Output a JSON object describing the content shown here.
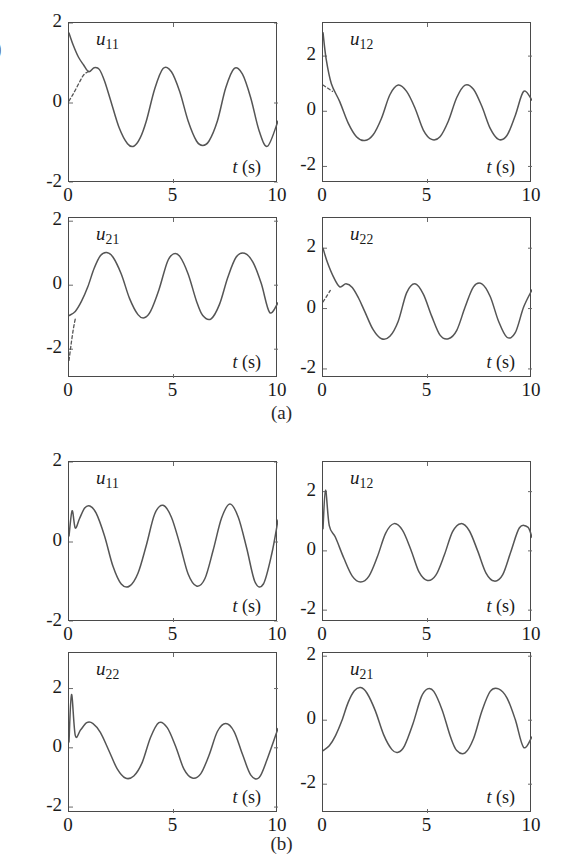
{
  "figure": {
    "edge_artifact": ")",
    "panels": [
      {
        "id": "a",
        "caption": "(a)",
        "subplots": [
          {
            "name": "u11",
            "label_base": "u",
            "label_sub": "11",
            "xlabel_italic": "t",
            "xlabel_rest": " (s)",
            "yticks": [
              "2",
              "0",
              "-2"
            ],
            "ytick_vals": [
              2,
              0,
              -2
            ],
            "xticks": [
              "0",
              "5",
              "10"
            ],
            "xtick_vals": [
              0,
              5,
              10
            ],
            "ylim": [
              -2,
              2
            ],
            "xlim": [
              0,
              10
            ],
            "has_dashed": true
          },
          {
            "name": "u12",
            "label_base": "u",
            "label_sub": "12",
            "xlabel_italic": "t",
            "xlabel_rest": " (s)",
            "yticks": [
              "2",
              "0",
              "-2"
            ],
            "ytick_vals": [
              2,
              0,
              -2
            ],
            "xticks": [
              "0",
              "5",
              "10"
            ],
            "xtick_vals": [
              0,
              5,
              10
            ],
            "ylim": [
              -2.6,
              3.2
            ],
            "xlim": [
              0,
              10
            ],
            "has_dashed": true
          },
          {
            "name": "u21",
            "label_base": "u",
            "label_sub": "21",
            "xlabel_italic": "t",
            "xlabel_rest": " (s)",
            "yticks": [
              "2",
              "0",
              "-2"
            ],
            "ytick_vals": [
              2,
              0,
              -2
            ],
            "xticks": [
              "0",
              "5",
              "10"
            ],
            "xtick_vals": [
              0,
              5,
              10
            ],
            "ylim": [
              -2.9,
              2.1
            ],
            "xlim": [
              0,
              10
            ],
            "has_dashed": true
          },
          {
            "name": "u22",
            "label_base": "u",
            "label_sub": "22",
            "xlabel_italic": "t",
            "xlabel_rest": " (s)",
            "yticks": [
              "2",
              "0",
              "-2"
            ],
            "ytick_vals": [
              2,
              0,
              -2
            ],
            "xticks": [
              "0",
              "5",
              "10"
            ],
            "xtick_vals": [
              0,
              5,
              10
            ],
            "ylim": [
              -2.3,
              3.0
            ],
            "xlim": [
              0,
              10
            ],
            "has_dashed": true
          }
        ]
      },
      {
        "id": "b",
        "caption": "(b)",
        "subplots": [
          {
            "name": "u11",
            "label_base": "u",
            "label_sub": "11",
            "xlabel_italic": "t",
            "xlabel_rest": " (s)",
            "yticks": [
              "2",
              "0",
              "-2"
            ],
            "ytick_vals": [
              2,
              0,
              -2
            ],
            "xticks": [
              "0",
              "5",
              "10"
            ],
            "xtick_vals": [
              0,
              5,
              10
            ],
            "ylim": [
              -2,
              2
            ],
            "xlim": [
              0,
              10
            ],
            "has_dashed": false
          },
          {
            "name": "u12",
            "label_base": "u",
            "label_sub": "12",
            "xlabel_italic": "t",
            "xlabel_rest": " (s)",
            "yticks": [
              "2",
              "0",
              "-2"
            ],
            "ytick_vals": [
              2,
              0,
              -2
            ],
            "xticks": [
              "0",
              "5",
              "10"
            ],
            "xtick_vals": [
              0,
              5,
              10
            ],
            "ylim": [
              -2.4,
              3.0
            ],
            "xlim": [
              0,
              10
            ],
            "has_dashed": false
          },
          {
            "name": "u22",
            "label_base": "u",
            "label_sub": "22",
            "xlabel_italic": "t",
            "xlabel_rest": " (s)",
            "yticks": [
              "2",
              "0",
              "-2"
            ],
            "ytick_vals": [
              2,
              0,
              -2
            ],
            "xticks": [
              "0",
              "5",
              "10"
            ],
            "xtick_vals": [
              0,
              5,
              10
            ],
            "ylim": [
              -2.2,
              3.2
            ],
            "xlim": [
              0,
              10
            ],
            "has_dashed": false
          },
          {
            "name": "u21",
            "label_base": "u",
            "label_sub": "21",
            "xlabel_italic": "t",
            "xlabel_rest": " (s)",
            "yticks": [
              "2",
              "0",
              "-2"
            ],
            "ytick_vals": [
              2,
              0,
              -2
            ],
            "xticks": [
              "0",
              "5",
              "10"
            ],
            "xtick_vals": [
              0,
              5,
              10
            ],
            "ylim": [
              -2.9,
              2.1
            ],
            "xlim": [
              0,
              10
            ],
            "has_dashed": false
          }
        ]
      }
    ]
  },
  "chart_data": [
    {
      "type": "line",
      "title": "u11 (a)",
      "xlabel": "t (s)",
      "ylabel": "u11",
      "xlim": [
        0,
        10
      ],
      "ylim": [
        -2,
        2
      ],
      "xticks": [
        0,
        5,
        10
      ],
      "yticks": [
        -2,
        0,
        2
      ],
      "grid": false,
      "legend": "none",
      "series": [
        {
          "name": "solid",
          "style": "solid",
          "x": [
            0,
            0.2,
            0.45,
            0.7,
            0.95,
            1.2,
            1.45,
            1.7,
            2.0,
            2.4,
            2.8,
            3.1,
            3.4,
            3.7,
            4.1,
            4.5,
            4.9,
            5.3,
            5.7,
            6.1,
            6.4,
            6.7,
            7.1,
            7.5,
            7.9,
            8.3,
            8.7,
            9.1,
            9.5,
            10.0
          ],
          "y": [
            1.75,
            1.45,
            1.15,
            0.95,
            0.78,
            0.88,
            0.84,
            0.55,
            0.05,
            -0.62,
            -1.02,
            -1.08,
            -0.88,
            -0.45,
            0.35,
            0.86,
            0.78,
            0.28,
            -0.45,
            -0.95,
            -1.06,
            -0.95,
            -0.45,
            0.38,
            0.86,
            0.72,
            0.12,
            -0.7,
            -1.08,
            -0.45
          ]
        },
        {
          "name": "dashed-transient",
          "style": "dashed",
          "x": [
            0,
            0.15,
            0.3,
            0.5,
            0.7,
            0.95
          ],
          "y": [
            0.05,
            0.18,
            0.32,
            0.52,
            0.7,
            0.8
          ]
        }
      ]
    },
    {
      "type": "line",
      "title": "u12 (a)",
      "xlabel": "t (s)",
      "ylabel": "u12",
      "xlim": [
        0,
        10
      ],
      "ylim": [
        -2.6,
        3.2
      ],
      "xticks": [
        0,
        5,
        10
      ],
      "yticks": [
        -2,
        0,
        2
      ],
      "grid": false,
      "legend": "none",
      "series": [
        {
          "name": "solid",
          "style": "solid",
          "x": [
            0,
            0.15,
            0.4,
            0.8,
            1.2,
            1.6,
            2.0,
            2.4,
            2.8,
            3.2,
            3.6,
            4.0,
            4.4,
            4.8,
            5.2,
            5.6,
            6.0,
            6.4,
            6.8,
            7.2,
            7.6,
            8.0,
            8.4,
            8.8,
            9.2,
            9.6,
            10.0
          ],
          "y": [
            2.85,
            1.9,
            1.0,
            0.35,
            -0.42,
            -0.92,
            -1.06,
            -0.85,
            -0.25,
            0.6,
            0.95,
            0.72,
            0.12,
            -0.68,
            -1.02,
            -0.92,
            -0.35,
            0.5,
            0.95,
            0.8,
            0.18,
            -0.62,
            -1.02,
            -0.88,
            -0.15,
            0.72,
            0.4
          ]
        },
        {
          "name": "dashed-transient",
          "style": "dashed",
          "x": [
            0,
            0.2,
            0.45
          ],
          "y": [
            0.95,
            0.85,
            0.72
          ]
        }
      ]
    },
    {
      "type": "line",
      "title": "u21 (a)",
      "xlabel": "t (s)",
      "ylabel": "u21",
      "xlim": [
        0,
        10
      ],
      "ylim": [
        -2.9,
        2.1
      ],
      "xticks": [
        0,
        5,
        10
      ],
      "yticks": [
        -2,
        0,
        2
      ],
      "grid": false,
      "legend": "none",
      "series": [
        {
          "name": "solid",
          "style": "solid",
          "x": [
            0,
            0.3,
            0.6,
            0.9,
            1.2,
            1.5,
            1.8,
            2.1,
            2.5,
            2.9,
            3.3,
            3.6,
            3.9,
            4.3,
            4.7,
            5.0,
            5.3,
            5.7,
            6.1,
            6.4,
            6.8,
            7.2,
            7.6,
            8.0,
            8.4,
            8.8,
            9.2,
            9.6,
            10.0
          ],
          "y": [
            -0.95,
            -0.82,
            -0.5,
            -0.05,
            0.52,
            0.92,
            1.02,
            0.88,
            0.35,
            -0.42,
            -0.92,
            -1.02,
            -0.82,
            -0.15,
            0.72,
            0.98,
            0.9,
            0.35,
            -0.5,
            -0.95,
            -1.05,
            -0.6,
            0.25,
            0.88,
            1.0,
            0.72,
            0.05,
            -0.85,
            -0.55
          ]
        },
        {
          "name": "dashed-transient",
          "style": "dashed",
          "x": [
            0,
            0.1,
            0.2,
            0.3
          ],
          "y": [
            -2.35,
            -1.85,
            -1.4,
            -1.05
          ]
        }
      ]
    },
    {
      "type": "line",
      "title": "u22 (a)",
      "xlabel": "t (s)",
      "ylabel": "u22",
      "xlim": [
        0,
        10
      ],
      "ylim": [
        -2.3,
        3.0
      ],
      "xticks": [
        0,
        5,
        10
      ],
      "yticks": [
        -2,
        0,
        2
      ],
      "grid": false,
      "legend": "none",
      "series": [
        {
          "name": "solid",
          "style": "solid",
          "x": [
            0,
            0.2,
            0.5,
            0.8,
            1.1,
            1.4,
            1.7,
            2.0,
            2.4,
            2.8,
            3.2,
            3.6,
            4.0,
            4.4,
            4.8,
            5.2,
            5.6,
            6.0,
            6.4,
            6.8,
            7.2,
            7.6,
            8.0,
            8.4,
            8.8,
            9.2,
            9.6,
            10.0
          ],
          "y": [
            2.0,
            1.55,
            1.05,
            0.72,
            0.82,
            0.7,
            0.35,
            -0.1,
            -0.7,
            -1.0,
            -0.92,
            -0.42,
            0.52,
            0.82,
            0.48,
            -0.25,
            -0.88,
            -1.0,
            -0.72,
            0.05,
            0.72,
            0.82,
            0.4,
            -0.42,
            -0.95,
            -0.8,
            0.05,
            0.62
          ]
        },
        {
          "name": "dashed-transient",
          "style": "dashed",
          "x": [
            0,
            0.15,
            0.35
          ],
          "y": [
            0.22,
            0.38,
            0.6
          ]
        }
      ]
    },
    {
      "type": "line",
      "title": "u11 (b)",
      "xlabel": "t (s)",
      "ylabel": "u11",
      "xlim": [
        0,
        10
      ],
      "ylim": [
        -2,
        2
      ],
      "xticks": [
        0,
        5,
        10
      ],
      "yticks": [
        -2,
        0,
        2
      ],
      "grid": false,
      "legend": "none",
      "series": [
        {
          "name": "solid",
          "style": "solid",
          "x": [
            0,
            0.15,
            0.3,
            0.5,
            0.75,
            1.0,
            1.3,
            1.7,
            2.1,
            2.5,
            2.9,
            3.3,
            3.7,
            4.1,
            4.5,
            4.9,
            5.3,
            5.7,
            6.1,
            6.5,
            6.9,
            7.3,
            7.7,
            8.1,
            8.5,
            8.9,
            9.3,
            9.7,
            10.0
          ],
          "y": [
            0.15,
            0.78,
            0.35,
            0.58,
            0.85,
            0.9,
            0.72,
            0.15,
            -0.6,
            -1.05,
            -1.1,
            -0.78,
            -0.08,
            0.7,
            0.92,
            0.62,
            -0.05,
            -0.8,
            -1.1,
            -0.92,
            -0.2,
            0.6,
            0.95,
            0.62,
            -0.15,
            -1.0,
            -1.05,
            -0.3,
            0.55
          ]
        }
      ]
    },
    {
      "type": "line",
      "title": "u12 (b)",
      "xlabel": "t (s)",
      "ylabel": "u12",
      "xlim": [
        0,
        10
      ],
      "ylim": [
        -2.4,
        3.0
      ],
      "xticks": [
        0,
        5,
        10
      ],
      "yticks": [
        -2,
        0,
        2
      ],
      "grid": false,
      "legend": "none",
      "series": [
        {
          "name": "solid",
          "style": "solid",
          "x": [
            0,
            0.12,
            0.3,
            0.6,
            1.0,
            1.4,
            1.8,
            2.2,
            2.6,
            3.0,
            3.4,
            3.8,
            4.2,
            4.6,
            5.0,
            5.4,
            5.8,
            6.2,
            6.6,
            7.0,
            7.4,
            7.8,
            8.2,
            8.6,
            9.0,
            9.4,
            9.8,
            10.0
          ],
          "y": [
            0.75,
            2.05,
            0.85,
            0.45,
            -0.25,
            -0.85,
            -1.05,
            -0.85,
            -0.2,
            0.6,
            0.92,
            0.7,
            0.05,
            -0.72,
            -1.0,
            -0.82,
            -0.15,
            0.65,
            0.92,
            0.68,
            0.0,
            -0.75,
            -1.02,
            -0.8,
            0.0,
            0.78,
            0.8,
            0.45
          ]
        }
      ]
    },
    {
      "type": "line",
      "title": "u22 (b)",
      "xlabel": "t (s)",
      "ylabel": "u22",
      "xlim": [
        0,
        10
      ],
      "ylim": [
        -2.2,
        3.2
      ],
      "xticks": [
        0,
        5,
        10
      ],
      "yticks": [
        -2,
        0,
        2
      ],
      "grid": false,
      "legend": "none",
      "series": [
        {
          "name": "solid",
          "style": "solid",
          "x": [
            0,
            0.12,
            0.3,
            0.55,
            0.85,
            1.15,
            1.5,
            1.9,
            2.3,
            2.7,
            3.1,
            3.5,
            3.9,
            4.3,
            4.7,
            5.1,
            5.5,
            5.9,
            6.3,
            6.7,
            7.1,
            7.5,
            7.9,
            8.3,
            8.7,
            9.1,
            9.5,
            10.0
          ],
          "y": [
            0.2,
            1.8,
            0.42,
            0.6,
            0.85,
            0.82,
            0.52,
            -0.08,
            -0.7,
            -1.02,
            -0.95,
            -0.5,
            0.35,
            0.85,
            0.68,
            0.05,
            -0.72,
            -1.02,
            -0.88,
            -0.25,
            0.55,
            0.82,
            0.55,
            -0.22,
            -0.92,
            -1.0,
            -0.35,
            0.65
          ]
        }
      ]
    },
    {
      "type": "line",
      "title": "u21 (b)",
      "xlabel": "t (s)",
      "ylabel": "u21",
      "xlim": [
        0,
        10
      ],
      "ylim": [
        -2.9,
        2.1
      ],
      "xticks": [
        0,
        5,
        10
      ],
      "yticks": [
        -2,
        0,
        2
      ],
      "grid": false,
      "legend": "none",
      "series": [
        {
          "name": "solid",
          "style": "solid",
          "x": [
            0,
            0.3,
            0.6,
            0.9,
            1.2,
            1.5,
            1.8,
            2.1,
            2.5,
            2.9,
            3.3,
            3.6,
            3.9,
            4.3,
            4.7,
            5.0,
            5.3,
            5.7,
            6.1,
            6.4,
            6.8,
            7.2,
            7.6,
            8.0,
            8.4,
            8.8,
            9.2,
            9.6,
            10.0
          ],
          "y": [
            -0.95,
            -0.8,
            -0.48,
            -0.02,
            0.55,
            0.92,
            1.02,
            0.85,
            0.3,
            -0.45,
            -0.92,
            -1.0,
            -0.8,
            -0.12,
            0.72,
            0.98,
            0.9,
            0.32,
            -0.52,
            -0.95,
            -1.02,
            -0.58,
            0.28,
            0.9,
            0.98,
            0.7,
            0.02,
            -0.85,
            -0.52
          ]
        }
      ]
    }
  ]
}
